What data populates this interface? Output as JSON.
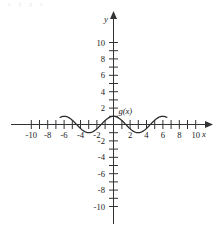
{
  "figure": {
    "artifact_text": "x  y  g  x",
    "axes": {
      "x_label": "x",
      "y_label": "y",
      "x_ticks_labeled": [
        "-10",
        "-8",
        "-6",
        "-4",
        "-2",
        "2",
        "4",
        "6",
        "8",
        "10"
      ],
      "y_ticks_labeled": [
        "10",
        "8",
        "6",
        "4",
        "2",
        "-2",
        "-4",
        "-6",
        "-8",
        "-10"
      ],
      "origin_label": ""
    },
    "curve_label": "g(x)",
    "colors": {
      "axis": "#333333",
      "curve": "#2b2b2b",
      "text": "#1a1a1a",
      "background": "#ffffff"
    }
  },
  "chart_data": {
    "type": "line",
    "title": "",
    "xlabel": "x",
    "ylabel": "y",
    "xlim": [
      -11.5,
      11.5
    ],
    "ylim": [
      -11.5,
      11.5
    ],
    "grid": false,
    "legend": "none",
    "xticks": [
      -10,
      -9,
      -8,
      -7,
      -6,
      -5,
      -4,
      -3,
      -2,
      -1,
      1,
      2,
      3,
      4,
      5,
      6,
      7,
      8,
      9,
      10
    ],
    "xtick_labels_shown": [
      -10,
      -8,
      -6,
      -4,
      -2,
      2,
      4,
      6,
      8,
      10
    ],
    "yticks": [
      -10,
      -9,
      -8,
      -7,
      -6,
      -5,
      -4,
      -3,
      -2,
      -1,
      1,
      2,
      3,
      4,
      5,
      6,
      7,
      8,
      9,
      10
    ],
    "ytick_labels_shown": [
      10,
      8,
      6,
      4,
      2,
      -2,
      -4,
      -6,
      -8,
      -10
    ],
    "series": [
      {
        "name": "g(x)",
        "annotation": "g(x)",
        "annotation_at": [
          0.6,
          1.6
        ],
        "description": "cosine-like wave, amplitude 1, period 6, maximum at x=0",
        "amplitude": 1,
        "period": 6,
        "x_domain": [
          -6.5,
          6.5
        ],
        "maxima": [
          [
            0,
            1
          ],
          [
            -6,
            1
          ],
          [
            6,
            1
          ]
        ],
        "minima": [
          [
            -3,
            -1
          ],
          [
            3,
            -1
          ]
        ],
        "zeros": [
          -4.5,
          -1.5,
          1.5,
          4.5
        ],
        "x": [
          -6.5,
          -6.0,
          -5.5,
          -5.0,
          -4.5,
          -4.0,
          -3.5,
          -3.0,
          -2.5,
          -2.0,
          -1.5,
          -1.0,
          -0.5,
          0.0,
          0.5,
          1.0,
          1.5,
          2.0,
          2.5,
          3.0,
          3.5,
          4.0,
          4.5,
          5.0,
          5.5,
          6.0,
          6.5
        ],
        "y": [
          0.87,
          1.0,
          0.87,
          0.5,
          0.0,
          -0.5,
          -0.87,
          -1.0,
          -0.87,
          -0.5,
          0.0,
          0.5,
          0.87,
          1.0,
          0.87,
          0.5,
          0.0,
          -0.5,
          -0.87,
          -1.0,
          -0.87,
          -0.5,
          0.0,
          0.5,
          0.87,
          1.0,
          0.87
        ]
      }
    ]
  }
}
